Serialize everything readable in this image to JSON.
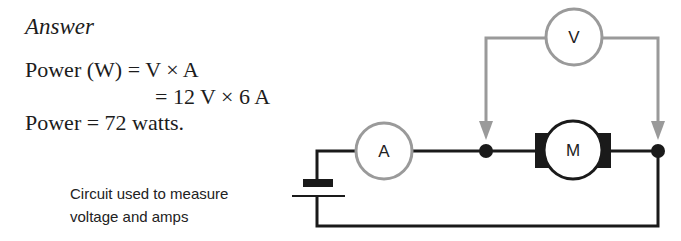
{
  "answer": {
    "heading": "Answer",
    "lines": [
      "Power (W) = V × A",
      "= 12 V × 6 A",
      "Power = 72 watts."
    ]
  },
  "caption": {
    "line1": "Circuit used to measure",
    "line2": "voltage and amps"
  },
  "circuit": {
    "ammeter_label": "A",
    "voltmeter_label": "V",
    "motor_label": "M",
    "colors": {
      "main_wire": "#1a1a1a",
      "meter_wire": "#9a9a9a",
      "meter_outline": "#9a9a9a"
    }
  }
}
